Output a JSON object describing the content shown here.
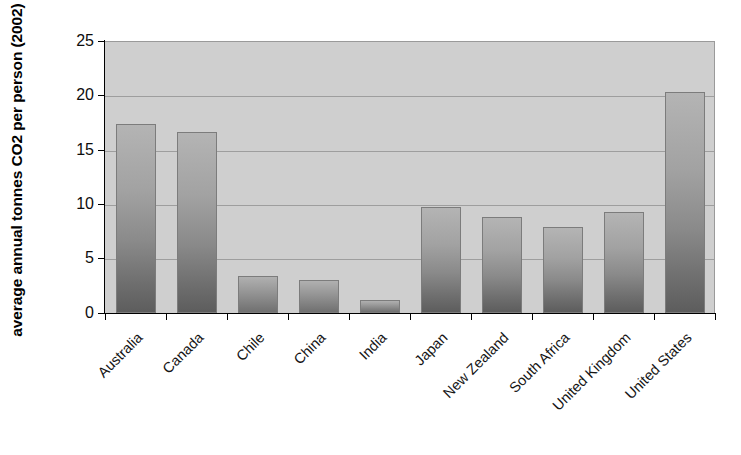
{
  "chart_data": {
    "type": "bar",
    "title": "",
    "subtitle": "",
    "xlabel": "",
    "ylabel": "average annual tonnes CO2 per person (2002)",
    "categories": [
      "Australia",
      "Canada",
      "Chile",
      "China",
      "India",
      "Japan",
      "New Zealand",
      "South Africa",
      "United Kingdom",
      "United States"
    ],
    "values": [
      17.4,
      16.6,
      3.4,
      3.0,
      1.2,
      9.7,
      8.8,
      7.9,
      9.3,
      20.3
    ],
    "ylim": [
      0,
      25
    ],
    "ytick_labels": [
      "0",
      "5",
      "10",
      "15",
      "20",
      "25"
    ],
    "ytick_values": [
      0,
      5,
      10,
      15,
      20,
      25
    ],
    "grid": true,
    "grid_axis": "y",
    "legend": false,
    "legend_position": "none",
    "series": [
      {
        "name": "average annual tonnes CO2 per person (2002)",
        "values": [
          17.4,
          16.6,
          3.4,
          3.0,
          1.2,
          9.7,
          8.8,
          7.9,
          9.3,
          20.3
        ]
      }
    ],
    "colors": {
      "plot_background": "#cfcfcf",
      "figure_background": "#ffffff",
      "gridline": "#9e9e9e",
      "axis": "#000000",
      "bar_top": "#b4b4b4",
      "bar_bottom": "#5d5d5d",
      "text": "#0d0d0d"
    }
  }
}
